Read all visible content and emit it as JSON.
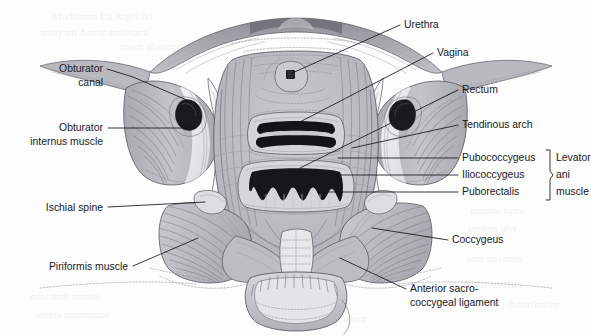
{
  "figure": {
    "style": "grayscale halftone medical illustration, scanned book page"
  },
  "colors": {
    "page_background": "#fdfdfd",
    "ink": "#19191c",
    "leader_line": "#15151a",
    "outline": "#4a4a50",
    "fiber_mid": "#77777f",
    "fiber_light": "#9a9aa1",
    "muscle_light": "#cfcfd4",
    "muscle_mid": "#b4b4ba",
    "muscle_dark": "#9a9aa2",
    "bone_pale": "#e6e6e9",
    "highlight_white": "#fafafa",
    "orifice_black": "#1a1a1d",
    "bleed_through": "#d8d8dc"
  },
  "labels_left": [
    {
      "id": "obturator-canal",
      "lines": [
        "Obturator",
        "canal"
      ],
      "text_anchor": "end",
      "text_x": 103,
      "text_y": [
        72,
        86
      ],
      "leader": "M 107 69 L 133 77 L 196 104",
      "target": [
        196,
        104
      ]
    },
    {
      "id": "obturator-internus-muscle",
      "lines": [
        "Obturator",
        "internus muscle"
      ],
      "text_anchor": "end",
      "text_x": 103,
      "text_y": [
        131,
        145
      ],
      "leader": "M 108 128 L 192 128",
      "target": [
        192,
        128
      ]
    },
    {
      "id": "ischial-spine",
      "lines": [
        "Ischial spine"
      ],
      "text_anchor": "end",
      "text_x": 103,
      "text_y": [
        211
      ],
      "leader": "M 108 207 L 205 202",
      "target": [
        205,
        202
      ]
    },
    {
      "id": "piriformis-muscle",
      "lines": [
        "Piriformis muscle"
      ],
      "text_anchor": "end",
      "text_x": 128,
      "text_y": [
        270
      ],
      "leader": "M 133 266 L 198 238",
      "target": [
        198,
        238
      ]
    }
  ],
  "labels_right": [
    {
      "id": "urethra",
      "lines": [
        "Urethra"
      ],
      "text_anchor": "start",
      "text_x": 404,
      "text_y": [
        28
      ],
      "leader": "M 400 25 L 290 74",
      "target": [
        290,
        74
      ]
    },
    {
      "id": "vagina",
      "lines": [
        "Vagina"
      ],
      "text_anchor": "start",
      "text_x": 437,
      "text_y": [
        56
      ],
      "leader": "M 433 53 L 296 124",
      "target": [
        296,
        124
      ]
    },
    {
      "id": "rectum",
      "lines": [
        "Rectum"
      ],
      "text_anchor": "start",
      "text_x": 462,
      "text_y": [
        93
      ],
      "leader": "M 458 90 L 300 168",
      "target": [
        300,
        168
      ]
    },
    {
      "id": "tendinous-arch",
      "lines": [
        "Tendinous arch"
      ],
      "text_anchor": "start",
      "text_x": 462,
      "text_y": [
        128
      ],
      "leader": "M 458 125 L 352 148",
      "target": [
        352,
        148
      ]
    },
    {
      "id": "pubococcygeus",
      "lines": [
        "Pubococcygeus"
      ],
      "text_anchor": "start",
      "text_x": 462,
      "text_y": [
        161
      ],
      "leader": "M 458 158 L 338 158",
      "target": [
        338,
        158
      ]
    },
    {
      "id": "iliococcygeus",
      "lines": [
        "Iliococcygeus"
      ],
      "text_anchor": "start",
      "text_x": 462,
      "text_y": [
        178
      ],
      "leader": "M 458 175 L 330 175",
      "target": [
        330,
        175
      ]
    },
    {
      "id": "puborectalis",
      "lines": [
        "Puborectalis"
      ],
      "text_anchor": "start",
      "text_x": 462,
      "text_y": [
        195
      ],
      "leader": "M 458 192 L 318 192",
      "target": [
        318,
        192
      ]
    },
    {
      "id": "coccygeus",
      "lines": [
        "Coccygeus"
      ],
      "text_anchor": "start",
      "text_x": 452,
      "text_y": [
        243
      ],
      "leader": "M 448 240 L 372 228",
      "target": [
        372,
        228
      ]
    },
    {
      "id": "anterior-sacrococcygeal-ligament",
      "lines": [
        "Anterior sacro-",
        "coccygeal ligament"
      ],
      "text_anchor": "start",
      "text_x": 410,
      "text_y": [
        292,
        306
      ],
      "leader": "M 406 289 L 340 258",
      "target": [
        340,
        258
      ]
    }
  ],
  "brace_group": {
    "id": "levator-ani-muscle",
    "lines": [
      "Levator",
      "ani",
      "muscle"
    ],
    "text_x": 556,
    "text_y": [
      161,
      178,
      195
    ],
    "members": [
      "Pubococcygeus",
      "Iliococcygeus",
      "Puborectalis"
    ],
    "brace_path": "M 546 150 L 550 150 L 550 171 L 553 175 L 550 179 L 550 200 L 546 200"
  },
  "structures": [
    {
      "id": "pubic-symphysis",
      "name": "Pubic symphysis"
    },
    {
      "id": "urethral-hiatus",
      "name": "Urethral hiatus"
    },
    {
      "id": "vaginal-hiatus",
      "name": "Vaginal hiatus"
    },
    {
      "id": "rectal-hiatus",
      "name": "Rectal hiatus"
    },
    {
      "id": "obturator-canal-left",
      "name": "Left obturator canal"
    },
    {
      "id": "obturator-canal-right",
      "name": "Right obturator canal"
    },
    {
      "id": "coccyx",
      "name": "Coccyx"
    },
    {
      "id": "sacrum",
      "name": "Sacrum"
    }
  ],
  "bleed_through_text": [
    "barely legible reverse-side print",
    "scanned page show-through"
  ]
}
